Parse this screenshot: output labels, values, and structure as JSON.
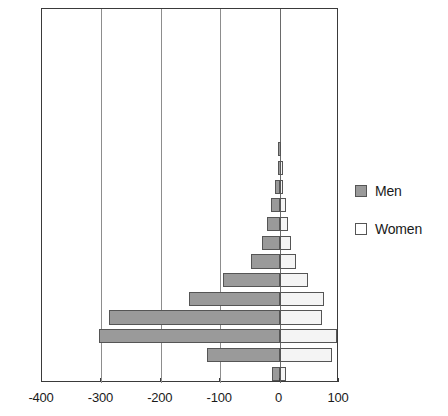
{
  "chart_data": {
    "type": "bar",
    "subtype": "population-pyramid",
    "title": "",
    "subtitle": "",
    "xlabel": "",
    "ylabel": "",
    "orientation": "horizontal",
    "grid": true,
    "xlim": [
      -400,
      100
    ],
    "xticks": [
      -400,
      -300,
      -200,
      -100,
      0,
      100
    ],
    "xtick_labels": [
      "-400",
      "-300",
      "-200",
      "-100",
      "0",
      "100"
    ],
    "ylim": [
      0,
      100
    ],
    "yticks": [
      0,
      5,
      10,
      15,
      20,
      25,
      30,
      35,
      40,
      45,
      50,
      55,
      60,
      65,
      70,
      75,
      80,
      85,
      90,
      95,
      100
    ],
    "ytick_labels": [
      "0",
      "5",
      "10",
      "15",
      "20",
      "25",
      "30",
      "35",
      "40",
      "45",
      "50",
      "55",
      "60",
      "65",
      "70",
      "75",
      "80",
      "85",
      "90",
      "95",
      "100"
    ],
    "legend_position": "right",
    "categories": [
      "0-5",
      "5-10",
      "10-15",
      "15-20",
      "20-25",
      "25-30",
      "30-35",
      "35-40",
      "40-45",
      "45-50",
      "50-55",
      "55-60",
      "60-65",
      "65-70",
      "70-75",
      "75-80",
      "80-85",
      "85-90",
      "90-95",
      "95-100"
    ],
    "series": [
      {
        "name": "Men",
        "color": "#9a9a9a",
        "values": [
          -12,
          -122,
          -304,
          -287,
          -152,
          -95,
          -48,
          -30,
          -22,
          -14,
          -8,
          -3,
          -2,
          0,
          0,
          0,
          0,
          0,
          0,
          0
        ]
      },
      {
        "name": "Women",
        "color": "#ffffff",
        "values": [
          10,
          88,
          96,
          72,
          74,
          48,
          28,
          20,
          14,
          10,
          6,
          2,
          1,
          0,
          0,
          0,
          0,
          0,
          0,
          0
        ]
      }
    ]
  },
  "legend": {
    "entries": [
      {
        "label": "Men",
        "swatch": "men"
      },
      {
        "label": "Women",
        "swatch": "women"
      }
    ]
  }
}
